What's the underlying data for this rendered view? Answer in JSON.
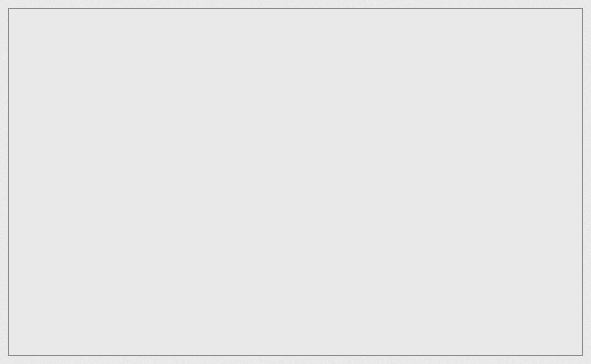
{
  "figure": {
    "title": "",
    "background_color": "#e9e9e9",
    "frame_color": "#8a8a8a",
    "width": 591,
    "height": 364,
    "panel_count": 2
  },
  "palette": {
    "top_face": "#d2d2d2",
    "left_face": "#b6b6b6",
    "right_face": "#9a9a9a",
    "edge": "#4a4a4a",
    "background": "#e9e9e9",
    "frame": "#8a8a8a"
  },
  "chart_data": [
    {
      "type": "bar",
      "subtype": "isometric-3d-bar",
      "title": "",
      "xlabel": "",
      "ylabel": "",
      "zlabel": "",
      "grid": false,
      "legend": null,
      "nx": 9,
      "ny": 9,
      "x": [
        1,
        2,
        3,
        4,
        5,
        6,
        7,
        8,
        9
      ],
      "y": [
        1,
        2,
        3,
        4,
        5,
        6,
        7,
        8,
        9
      ],
      "zlim": [
        0,
        13
      ],
      "projection": "isometric",
      "origin_px": [
        151,
        310
      ],
      "cell_px": 12.6,
      "unit_height_px": 10.6,
      "values": [
        [
          4,
          5,
          6,
          7,
          8,
          7,
          6,
          5,
          4
        ],
        [
          5,
          6,
          7,
          9,
          10,
          9,
          7,
          6,
          5
        ],
        [
          6,
          7,
          9,
          10,
          11,
          10,
          9,
          7,
          6
        ],
        [
          7,
          9,
          10,
          12,
          12,
          12,
          10,
          9,
          7
        ],
        [
          8,
          10,
          11,
          12,
          13,
          12,
          11,
          10,
          8
        ],
        [
          7,
          9,
          10,
          12,
          12,
          12,
          10,
          9,
          7
        ],
        [
          6,
          7,
          9,
          10,
          11,
          10,
          9,
          7,
          6
        ],
        [
          5,
          6,
          7,
          9,
          10,
          9,
          7,
          6,
          5
        ],
        [
          4,
          5,
          6,
          7,
          8,
          7,
          6,
          5,
          4
        ]
      ]
    },
    {
      "type": "bar",
      "subtype": "isometric-3d-bar",
      "title": "",
      "xlabel": "",
      "ylabel": "",
      "zlabel": "",
      "grid": false,
      "legend": null,
      "nx": 18,
      "ny": 18,
      "x": [
        1,
        2,
        3,
        4,
        5,
        6,
        7,
        8,
        9,
        10,
        11,
        12,
        13,
        14,
        15,
        16,
        17,
        18
      ],
      "y": [
        1,
        2,
        3,
        4,
        5,
        6,
        7,
        8,
        9,
        10,
        11,
        12,
        13,
        14,
        15,
        16,
        17,
        18
      ],
      "zlim": [
        0,
        26
      ],
      "projection": "isometric",
      "origin_px": [
        448,
        312
      ],
      "cell_px": 6.3,
      "unit_height_px": 5.3,
      "surface_function": "dome: z = base + amp * cos(pi*u/2) * cos(pi*v/2)",
      "base_level": 8,
      "amplitude": 18
    }
  ]
}
